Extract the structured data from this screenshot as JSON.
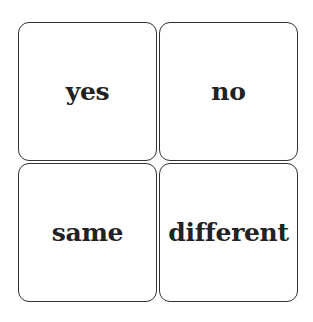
{
  "cards": [
    {
      "label": "yes"
    },
    {
      "label": "no"
    },
    {
      "label": "same"
    },
    {
      "label": "different"
    }
  ],
  "colors": {
    "border": "#333333",
    "text": "#222222",
    "background": "#ffffff"
  }
}
